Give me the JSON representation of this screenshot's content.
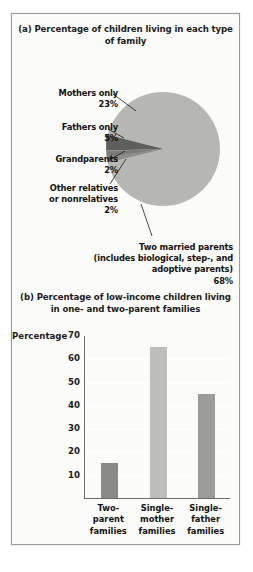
{
  "figure": {
    "border_color": "#9a9a96",
    "background": "#fbfbf9"
  },
  "panel_a": {
    "title": "(a) Percentage of children living\nin each type of family",
    "labels": {
      "mothers": "Mothers only\n23%",
      "fathers": "Fathers only\n5%",
      "grandparents": "Grandparents\n2%",
      "other": "Other relatives\nor nonrelatives\n2%",
      "married": "Two married parents\n(includes biological, step-, and\nadoptive parents)\n68%"
    }
  },
  "panel_b": {
    "title": "(b) Percentage of low-income children living\nin one- and two-parent families",
    "axis_title": "Percentage"
  },
  "chart_data": [
    {
      "type": "pie",
      "title": "(a) Percentage of children living in each type of family",
      "slices": [
        {
          "label": "Two married parents (includes biological, step-, and adoptive parents)",
          "value": 68,
          "color": "#b6b6b2"
        },
        {
          "label": "Mothers only",
          "value": 23,
          "color": "#b6b6b2"
        },
        {
          "label": "Fathers only",
          "value": 5,
          "color": "#6b6b68"
        },
        {
          "label": "Grandparents",
          "value": 2,
          "color": "#58585a"
        },
        {
          "label": "Other relatives or nonrelatives",
          "value": 2,
          "color": "#7e7e7c"
        }
      ],
      "units": "percent",
      "legend": "callout labels",
      "note": "Mothers only and Two married parents wedges render in the same light gray; the three small wedges are darker."
    },
    {
      "type": "bar",
      "title": "(b) Percentage of low-income children living in one- and two-parent families",
      "categories": [
        "Two-parent families",
        "Single-mother families",
        "Single-father families"
      ],
      "category_lines": [
        [
          "Two-",
          "parent",
          "families"
        ],
        [
          "Single-",
          "mother",
          "families"
        ],
        [
          "Single-",
          "father",
          "families"
        ]
      ],
      "values": [
        15,
        65,
        44.5
      ],
      "bar_colors": [
        "#8a8a87",
        "#bdbdb9",
        "#9b9b98"
      ],
      "xlabel": "",
      "ylabel": "Percentage",
      "ylim": [
        0,
        70
      ],
      "yticks": [
        10,
        20,
        30,
        40,
        50,
        60,
        70
      ],
      "ytick_labels": [
        "10",
        "20",
        "30",
        "40",
        "50",
        "60",
        "70"
      ],
      "grid": true,
      "grid_color": "#ffffff",
      "legend": "none"
    }
  ]
}
